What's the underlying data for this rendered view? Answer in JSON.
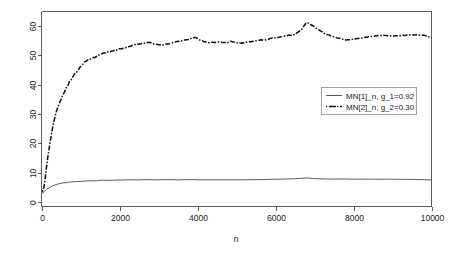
{
  "chart_data": {
    "type": "line",
    "title": "",
    "subtitle": "",
    "xlabel": "n",
    "ylabel": "",
    "xlim": [
      0,
      10000
    ],
    "ylim": [
      -1.5,
      65
    ],
    "grid": false,
    "legend_position": "right",
    "x_ticks": [
      0,
      2000,
      4000,
      6000,
      8000,
      10000
    ],
    "x_tick_labels": [
      "0",
      "2000",
      "4000",
      "6000",
      "8000",
      "10000"
    ],
    "y_ticks": [
      0,
      10,
      20,
      30,
      40,
      50,
      60
    ],
    "y_tick_labels": [
      "0",
      "10",
      "20",
      "30",
      "40",
      "50",
      "60"
    ],
    "series": [
      {
        "name": "MN[1]_n, g_1=0.92",
        "style": "solid",
        "x": [
          20,
          60,
          100,
          140,
          180,
          220,
          260,
          300,
          350,
          400,
          450,
          500,
          560,
          620,
          700,
          780,
          860,
          940,
          1020,
          1100,
          1200,
          1300,
          1400,
          1500,
          1600,
          1700,
          1800,
          1900,
          2000,
          2150,
          2300,
          2450,
          2600,
          2750,
          2900,
          3050,
          3200,
          3350,
          3500,
          3650,
          3800,
          3950,
          4100,
          4250,
          4400,
          4550,
          4700,
          4850,
          5000,
          5150,
          5300,
          5450,
          5600,
          5750,
          5900,
          6050,
          6200,
          6350,
          6500,
          6650,
          6800,
          6950,
          7100,
          7250,
          7400,
          7550,
          7700,
          7850,
          8000,
          8200,
          8400,
          8600,
          8800,
          9000,
          9200,
          9400,
          9600,
          9800,
          10000
        ],
        "y": [
          2.9,
          3.3,
          3.9,
          4.4,
          4.8,
          5.1,
          5.4,
          5.6,
          5.9,
          6.1,
          6.25,
          6.4,
          6.55,
          6.65,
          6.8,
          6.9,
          6.95,
          7.05,
          7.1,
          7.15,
          7.25,
          7.3,
          7.32,
          7.38,
          7.42,
          7.45,
          7.45,
          7.5,
          7.52,
          7.55,
          7.6,
          7.58,
          7.62,
          7.65,
          7.6,
          7.62,
          7.68,
          7.62,
          7.6,
          7.65,
          7.7,
          7.62,
          7.6,
          7.58,
          7.62,
          7.6,
          7.56,
          7.62,
          7.58,
          7.6,
          7.65,
          7.62,
          7.7,
          7.72,
          7.78,
          7.82,
          7.85,
          7.9,
          8.0,
          8.1,
          8.25,
          8.05,
          7.95,
          7.9,
          7.85,
          7.88,
          7.9,
          7.86,
          7.82,
          7.85,
          7.82,
          7.8,
          7.82,
          7.8,
          7.78,
          7.75,
          7.72,
          7.65,
          7.55
        ]
      },
      {
        "name": "MN[2]_n, g_2=0.30",
        "style": "dotdash",
        "x": [
          20,
          60,
          100,
          140,
          180,
          220,
          260,
          300,
          350,
          400,
          450,
          500,
          560,
          620,
          700,
          780,
          860,
          940,
          1020,
          1100,
          1200,
          1300,
          1400,
          1500,
          1600,
          1700,
          1800,
          1900,
          2000,
          2150,
          2300,
          2450,
          2600,
          2750,
          2900,
          3050,
          3200,
          3350,
          3500,
          3650,
          3800,
          3950,
          4100,
          4250,
          4400,
          4550,
          4700,
          4850,
          5000,
          5150,
          5300,
          5450,
          5600,
          5750,
          5900,
          6050,
          6200,
          6350,
          6500,
          6650,
          6800,
          6950,
          7100,
          7250,
          7400,
          7550,
          7700,
          7850,
          8000,
          8200,
          8400,
          8600,
          8800,
          9000,
          9200,
          9400,
          9600,
          9800,
          10000
        ],
        "y": [
          2.8,
          5.5,
          9.0,
          13.0,
          17.0,
          20.5,
          23.5,
          26.0,
          29.0,
          31.5,
          33.5,
          35.2,
          37.0,
          38.6,
          40.5,
          42.2,
          43.8,
          45.2,
          46.5,
          47.6,
          48.7,
          49.3,
          49.6,
          50.2,
          50.8,
          51.3,
          51.5,
          51.9,
          52.2,
          52.6,
          53.2,
          53.8,
          54.2,
          54.5,
          53.9,
          53.5,
          53.8,
          54.3,
          54.8,
          55.2,
          55.6,
          56.2,
          55.0,
          54.5,
          54.4,
          54.6,
          54.3,
          54.8,
          54.4,
          54.2,
          54.6,
          55.0,
          55.2,
          55.4,
          55.8,
          56.2,
          56.6,
          56.9,
          57.2,
          58.6,
          61.3,
          60.2,
          58.8,
          57.6,
          56.8,
          56.2,
          55.6,
          55.3,
          55.6,
          56.0,
          56.4,
          56.7,
          56.9,
          56.6,
          56.8,
          57.0,
          57.1,
          56.9,
          56.0
        ]
      }
    ],
    "legend": {
      "entries": [
        {
          "label": "MN[1]_n, g_1=0.92",
          "style": "solid"
        },
        {
          "label": "MN[2]_n, g_2=0.30",
          "style": "dotdash"
        }
      ]
    }
  },
  "colors": {
    "background": "#ffffff",
    "axis": "#4d4d4d",
    "series_solid": "#2b2b2b",
    "series_dotdash": "#0d0d0d",
    "legend_border": "#8c8c8c",
    "text": "#1a1a1a"
  }
}
